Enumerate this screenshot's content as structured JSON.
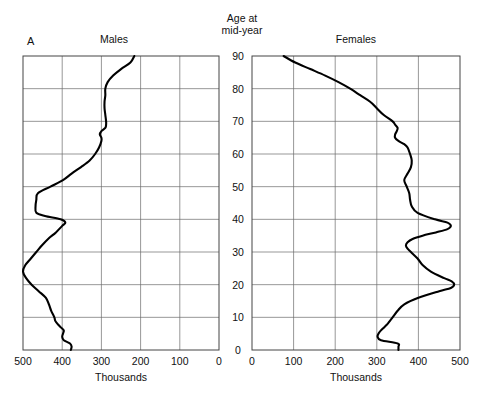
{
  "figure": {
    "letter": "A",
    "center_caption_line1": "Age at",
    "center_caption_line2": "mid-year",
    "males_title": "Males",
    "females_title": "Females",
    "males_axis_caption": "Thousands",
    "females_axis_caption": "Thousands"
  },
  "chart_data": {
    "type": "line",
    "title": "Age at mid-year",
    "subtitle": "",
    "xlabel": "Thousands",
    "ylabel": "Age at mid-year",
    "grid": true,
    "legend_position": "none",
    "panels": [
      {
        "name": "Males",
        "orientation": "horizontal-reversed",
        "xlabel": "Thousands",
        "xlim": [
          500,
          0
        ],
        "xticks": [
          500,
          400,
          300,
          200,
          100,
          0
        ],
        "xticklabels": [
          "500",
          "400",
          "300",
          "200",
          "100",
          "0"
        ],
        "ylim": [
          0,
          90
        ],
        "yticks": [
          0,
          10,
          20,
          30,
          40,
          50,
          60,
          70,
          80,
          90
        ],
        "yticklabels": [
          "0",
          "10",
          "20",
          "30",
          "40",
          "50",
          "60",
          "70",
          "80",
          "90"
        ],
        "age": [
          0,
          1,
          2,
          3,
          4,
          5,
          6,
          7,
          8,
          9,
          10,
          12,
          14,
          16,
          18,
          20,
          22,
          24,
          26,
          28,
          30,
          32,
          34,
          36,
          38,
          39,
          40,
          41,
          42,
          44,
          46,
          48,
          50,
          52,
          54,
          56,
          58,
          60,
          62,
          64,
          65,
          66,
          67,
          68,
          69,
          70,
          72,
          74,
          76,
          78,
          80,
          82,
          84,
          86,
          88,
          90
        ],
        "thousands": [
          378,
          376,
          380,
          396,
          400,
          398,
          396,
          404,
          412,
          418,
          420,
          428,
          434,
          442,
          460,
          478,
          492,
          500,
          494,
          480,
          466,
          452,
          436,
          416,
          400,
          392,
          404,
          444,
          466,
          468,
          466,
          462,
          430,
          398,
          376,
          352,
          330,
          316,
          306,
          300,
          300,
          304,
          300,
          290,
          288,
          288,
          290,
          292,
          292,
          290,
          290,
          284,
          270,
          250,
          226,
          216
        ]
      },
      {
        "name": "Females",
        "orientation": "horizontal",
        "xlabel": "Thousands",
        "xlim": [
          0,
          500
        ],
        "xticks": [
          0,
          100,
          200,
          300,
          400,
          500
        ],
        "xticklabels": [
          "0",
          "100",
          "200",
          "300",
          "400",
          "500"
        ],
        "ylim": [
          0,
          90
        ],
        "yticks": [
          0,
          10,
          20,
          30,
          40,
          50,
          60,
          70,
          80,
          90
        ],
        "yticklabels": [
          "0",
          "10",
          "20",
          "30",
          "40",
          "50",
          "60",
          "70",
          "80",
          "90"
        ],
        "age": [
          0,
          1,
          2,
          3,
          4,
          5,
          6,
          7,
          8,
          9,
          10,
          12,
          14,
          16,
          18,
          19,
          20,
          21,
          22,
          24,
          26,
          28,
          30,
          31,
          32,
          33,
          34,
          35,
          36,
          37,
          38,
          39,
          40,
          42,
          44,
          46,
          48,
          50,
          52,
          54,
          56,
          58,
          60,
          62,
          63,
          64,
          65,
          66,
          67,
          68,
          69,
          70,
          72,
          74,
          76,
          78,
          80,
          82,
          84,
          86,
          88,
          90
        ],
        "thousands": [
          352,
          352,
          350,
          310,
          302,
          304,
          310,
          318,
          326,
          332,
          338,
          350,
          366,
          400,
          450,
          478,
          486,
          480,
          462,
          430,
          410,
          398,
          382,
          374,
          370,
          374,
          386,
          410,
          442,
          470,
          478,
          470,
          440,
          398,
          384,
          380,
          378,
          372,
          366,
          374,
          382,
          384,
          380,
          374,
          366,
          352,
          344,
          344,
          348,
          350,
          344,
          338,
          316,
          300,
          284,
          260,
          236,
          208,
          176,
          140,
          104,
          76
        ]
      }
    ]
  }
}
